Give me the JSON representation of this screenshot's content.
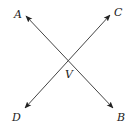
{
  "diagram": {
    "title": "",
    "vertex": {
      "label": "V",
      "x": 69,
      "y": 61,
      "label_x": 66,
      "label_y": 78
    },
    "rays": [
      {
        "name": "ray-A",
        "label": "A",
        "tip_x": 26,
        "tip_y": 16,
        "label_x": 14,
        "label_y": 18
      },
      {
        "name": "ray-B",
        "label": "B",
        "tip_x": 113,
        "tip_y": 108,
        "label_x": 117,
        "label_y": 121
      },
      {
        "name": "ray-C",
        "label": "C",
        "tip_x": 110,
        "tip_y": 15,
        "label_x": 114,
        "label_y": 16
      },
      {
        "name": "ray-D",
        "label": "D",
        "tip_x": 25,
        "tip_y": 108,
        "label_x": 12,
        "label_y": 121
      }
    ],
    "colors": {
      "line": "#444444",
      "text": "#222222",
      "background": "#ffffff"
    }
  }
}
